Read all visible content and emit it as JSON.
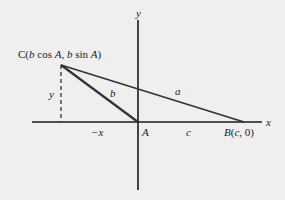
{
  "diagram": {
    "colors": {
      "background": "#efefef",
      "axis": "#1a1a1a",
      "triangle": "#333333",
      "text": "#222222"
    },
    "axes": {
      "x_label": "x",
      "y_label": "y",
      "origin": {
        "x": 138,
        "y": 122
      },
      "x_axis": {
        "x1": 32,
        "x2": 262
      },
      "y_axis": {
        "y1": 20,
        "y2": 190
      }
    },
    "points": {
      "A": {
        "label": "A",
        "x": 138,
        "y": 122
      },
      "B": {
        "label": "B(c, 0)",
        "x": 244,
        "y": 122
      },
      "C": {
        "label": "C(b cos A, b sin A)",
        "x": 61,
        "y": 65
      }
    },
    "sides": {
      "a": "a",
      "b": "b",
      "c": "c"
    },
    "annotations": {
      "vertical_height": "y",
      "horizontal_offset": "−x"
    }
  }
}
